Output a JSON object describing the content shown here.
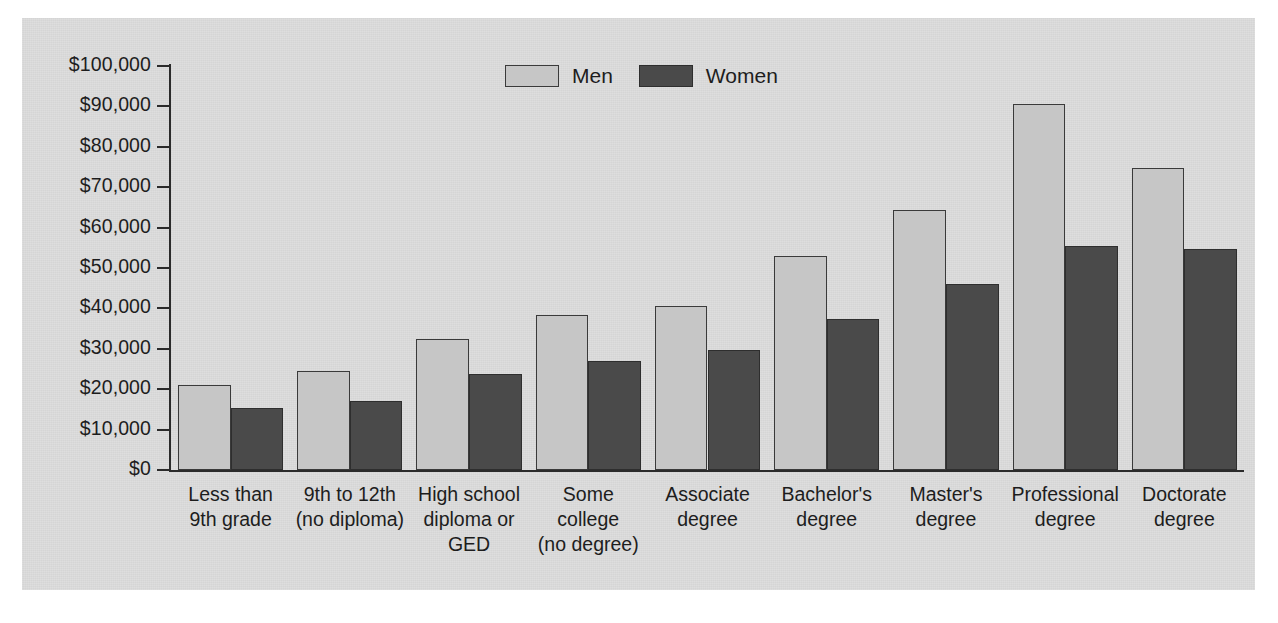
{
  "chart_data": {
    "type": "bar",
    "title": "",
    "subtitle": "",
    "xlabel": "",
    "ylabel": "",
    "ylim": [
      0,
      100000
    ],
    "ytick_step": 10000,
    "grid": false,
    "legend_position": "top-center",
    "axis_tick_labels": [
      "$100,000",
      "$90,000",
      "$80,000",
      "$70,000",
      "$60,000",
      "$50,000",
      "$40,000",
      "$30,000",
      "$20,000",
      "$10,000",
      "$0"
    ],
    "categories": [
      "Less than\n9th grade",
      "9th to 12th\n(no diploma)",
      "High school\ndiploma or\nGED",
      "Some\ncollege\n(no degree)",
      "Associate\ndegree",
      "Bachelor's\ndegree",
      "Master's\ndegree",
      "Professional\ndegree",
      "Doctorate\ndegree"
    ],
    "series": [
      {
        "name": "Men",
        "color": "#c6c6c6",
        "values": [
          21000,
          24500,
          32400,
          38300,
          40700,
          52900,
          64300,
          90600,
          74800
        ]
      },
      {
        "name": "Women",
        "color": "#4a4a4a",
        "values": [
          15400,
          17000,
          23700,
          26900,
          29700,
          37400,
          46100,
          55400,
          54800
        ]
      }
    ]
  },
  "legend": {
    "items": [
      {
        "label": "Men",
        "swatch": "men"
      },
      {
        "label": "Women",
        "swatch": "women"
      }
    ]
  }
}
